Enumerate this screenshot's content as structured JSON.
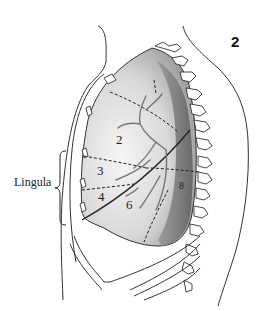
{
  "figure": {
    "number": "2",
    "lingula_label": "Lingula",
    "segments": [
      {
        "id": "2",
        "label": "2"
      },
      {
        "id": "3",
        "label": "3"
      },
      {
        "id": "4",
        "label": "4"
      },
      {
        "id": "6",
        "label": "6"
      },
      {
        "id": "8",
        "label": "8"
      }
    ],
    "colors": {
      "ink": "#222222",
      "lung_light": "#ececec",
      "lung_mid": "#b8b8b8",
      "lung_dark": "#7a7a7a",
      "background": "#ffffff"
    }
  }
}
